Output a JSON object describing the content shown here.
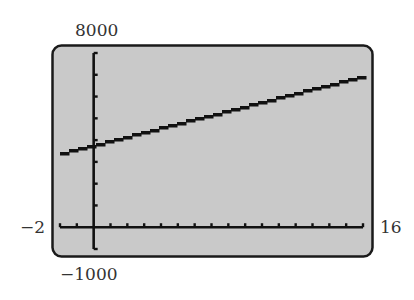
{
  "window": {
    "xmin_label": "−2",
    "xmax_label": "16",
    "ymin_label": "−1000",
    "ymax_label": "8000"
  },
  "colors": {
    "screen_bg": "#c9c9c9",
    "frame": "#1a1a1a",
    "axis": "#111111",
    "line": "#111111"
  },
  "chart_data": {
    "type": "line",
    "title": "",
    "xlabel": "",
    "ylabel": "",
    "xlim": [
      -2,
      16
    ],
    "ylim": [
      -1000,
      8000
    ],
    "xscale": 1,
    "yscale": 1000,
    "grid": false,
    "legend": null,
    "series": [
      {
        "name": "y",
        "x": [
          -2,
          0,
          2,
          4,
          6,
          8,
          10,
          12,
          14,
          16
        ],
        "values": [
          3374,
          3770,
          4166,
          4562,
          4958,
          5354,
          5750,
          6146,
          6542,
          6938
        ]
      }
    ]
  }
}
